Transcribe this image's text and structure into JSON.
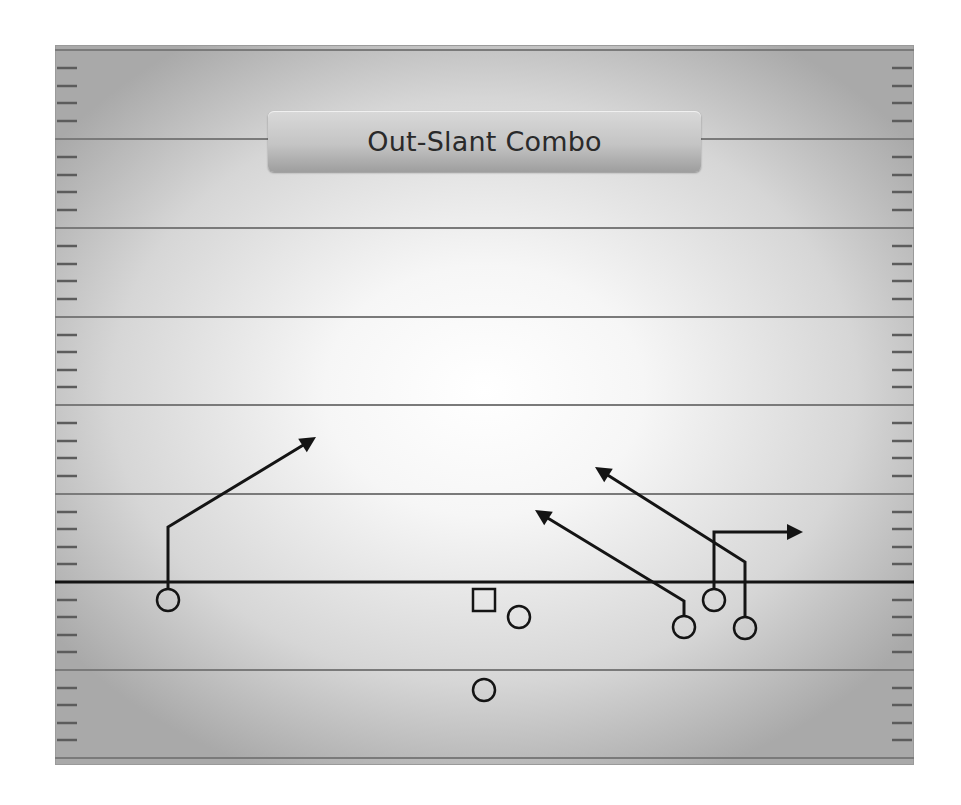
{
  "title": "Out-Slant Combo",
  "colors": {
    "ink": "#141414",
    "yard_line": "#7a7a7a",
    "hash": "#5c5c5c"
  },
  "field": {
    "left": 55,
    "top": 45,
    "right": 914,
    "bottom": 765,
    "yard_lines_y": [
      50,
      139,
      228,
      317,
      405,
      494,
      670,
      758
    ],
    "line_of_scrimmage_y": 582,
    "hash_left_x": [
      57,
      77
    ],
    "hash_right_x": [
      892,
      912
    ]
  },
  "players": [
    {
      "id": "wr-left",
      "shape": "circle",
      "x": 168,
      "y": 600,
      "r": 11
    },
    {
      "id": "center",
      "shape": "square",
      "x": 473,
      "y": 589,
      "size": 22
    },
    {
      "id": "guard",
      "shape": "circle",
      "x": 519,
      "y": 617,
      "r": 11
    },
    {
      "id": "back",
      "shape": "circle",
      "x": 484,
      "y": 690,
      "r": 11
    },
    {
      "id": "slot-inside",
      "shape": "circle",
      "x": 684,
      "y": 627,
      "r": 11
    },
    {
      "id": "slot-middle",
      "shape": "circle",
      "x": 714,
      "y": 600,
      "r": 11
    },
    {
      "id": "wr-right",
      "shape": "circle",
      "x": 745,
      "y": 628,
      "r": 11
    }
  ],
  "routes": [
    {
      "id": "route-wr-left",
      "points": [
        [
          168,
          589
        ],
        [
          168,
          527
        ],
        [
          305,
          444
        ]
      ],
      "tip": [
        316,
        437
      ]
    },
    {
      "id": "route-slot-inside-slant",
      "points": [
        [
          684,
          616
        ],
        [
          684,
          601
        ],
        [
          546,
          517
        ]
      ],
      "tip": [
        535,
        510
      ]
    },
    {
      "id": "route-slot-middle-out",
      "points": [
        [
          714,
          589
        ],
        [
          714,
          532
        ],
        [
          792,
          532
        ]
      ],
      "tip": [
        803,
        532
      ]
    },
    {
      "id": "route-wr-right-slant",
      "points": [
        [
          745,
          617
        ],
        [
          745,
          562
        ],
        [
          606,
          474
        ]
      ],
      "tip": [
        595,
        467
      ]
    }
  ]
}
